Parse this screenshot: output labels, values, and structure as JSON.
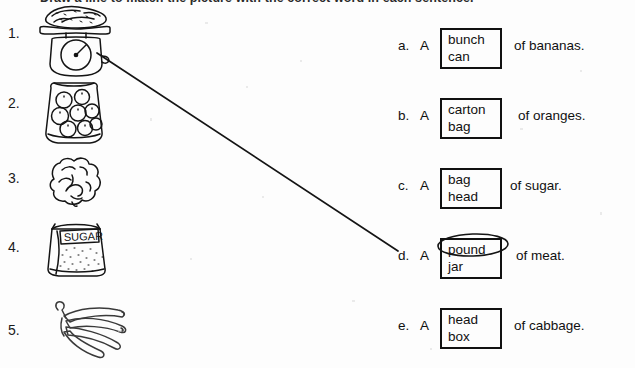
{
  "worksheet": {
    "instructions": "Draw a line to match the picture with the correct word in each sentence."
  },
  "pictures": [
    {
      "number": "1.",
      "icon": "kitchen-scale-with-meat-icon",
      "label": "scale weighing meat"
    },
    {
      "number": "2.",
      "icon": "bag-of-oranges-icon",
      "label": "bag of oranges"
    },
    {
      "number": "3.",
      "icon": "head-of-cabbage-icon",
      "label": "head of cabbage"
    },
    {
      "number": "4.",
      "icon": "bag-of-sugar-icon",
      "label": "bag of sugar",
      "package_text": "SUGAR"
    },
    {
      "number": "5.",
      "icon": "bunch-of-bananas-icon",
      "label": "bunch of bananas"
    }
  ],
  "choices": [
    {
      "letter": "a.",
      "article": "A",
      "options": [
        "bunch",
        "can"
      ],
      "tail": "of bananas.",
      "circled": null
    },
    {
      "letter": "b.",
      "article": "A",
      "options": [
        "carton",
        "bag"
      ],
      "tail": "of oranges.",
      "circled": null
    },
    {
      "letter": "c.",
      "article": "A",
      "options": [
        "bag",
        "head"
      ],
      "tail": "of sugar.",
      "circled": null
    },
    {
      "letter": "d.",
      "article": "A",
      "options": [
        "pound",
        "jar"
      ],
      "tail": "of meat.",
      "circled": "pound"
    },
    {
      "letter": "e.",
      "article": "A",
      "options": [
        "head",
        "box"
      ],
      "tail": "of cabbage.",
      "circled": null
    }
  ],
  "student_marks": {
    "connector_line": {
      "from_item": "1.",
      "to_choice": "d.",
      "x1": 97,
      "y1": 53,
      "x2": 398,
      "y2": 251
    },
    "circled_word": "pound"
  },
  "colors": {
    "ink": "#111111",
    "paper": "#fdfdfd",
    "pencil": "#1b1b1b"
  }
}
